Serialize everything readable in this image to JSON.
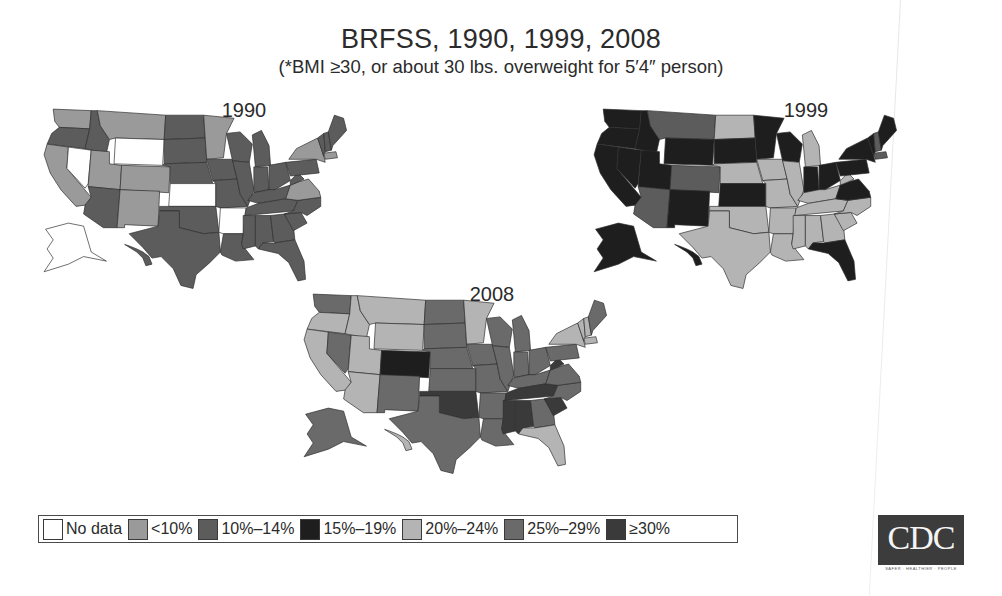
{
  "header": {
    "title": "BRFSS, 1990, 1999, 2008",
    "subtitle": "(*BMI ≥30, or about 30 lbs. overweight for 5′4″ person)"
  },
  "maps": [
    {
      "label": "1990"
    },
    {
      "label": "1999"
    },
    {
      "label": "2008"
    }
  ],
  "legend": {
    "items": [
      {
        "label": "No data",
        "color": "#ffffff"
      },
      {
        "label": "<10%",
        "color": "#9a9a9a"
      },
      {
        "label": "10%–14%",
        "color": "#5c5c5c"
      },
      {
        "label": "15%–19%",
        "color": "#1e1e1e"
      },
      {
        "label": "20%–24%",
        "color": "#b4b4b4"
      },
      {
        "label": "25%–29%",
        "color": "#6a6a6a"
      },
      {
        "label": "≥30%",
        "color": "#3a3a3a"
      }
    ]
  },
  "logo": {
    "text": "CDC",
    "tagline": "SAFER · HEALTHIER · PEOPLE"
  },
  "chart_data": {
    "type": "choropleth",
    "title": "BRFSS, 1990, 1999, 2008",
    "subtitle": "(*BMI ≥30, or about 30 lbs. overweight for 5′4″ person)",
    "categories": [
      "No data",
      "<10%",
      "10%–14%",
      "15%–19%",
      "20%–24%",
      "25%–29%",
      "≥30%"
    ],
    "legend_position": "bottom-left",
    "series": [
      {
        "name": "1990",
        "values": {
          "WA": "<10%",
          "OR": "10%–14%",
          "CA": "<10%",
          "NV": "No data",
          "ID": "10%–14%",
          "MT": "<10%",
          "WY": "No data",
          "UT": "<10%",
          "CO": "<10%",
          "AZ": "10%–14%",
          "NM": "<10%",
          "ND": "10%–14%",
          "SD": "10%–14%",
          "NE": "10%–14%",
          "KS": "No data",
          "OK": "10%–14%",
          "TX": "10%–14%",
          "MN": "<10%",
          "IA": "10%–14%",
          "MO": "10%–14%",
          "AR": "No data",
          "LA": "10%–14%",
          "WI": "10%–14%",
          "IL": "10%–14%",
          "MI": "10%–14%",
          "IN": "10%–14%",
          "OH": "10%–14%",
          "KY": "10%–14%",
          "TN": "10%–14%",
          "MS": "10%–14%",
          "AL": "10%–14%",
          "GA": "10%–14%",
          "FL": "10%–14%",
          "SC": "10%–14%",
          "NC": "10%–14%",
          "VA": "<10%",
          "WV": "10%–14%",
          "PA": "10%–14%",
          "NY": "<10%",
          "ME": "10%–14%",
          "VT": "10%–14%",
          "NH": "10%–14%",
          "MA": "<10%",
          "AK": "No data",
          "HI": "10%–14%"
        }
      },
      {
        "name": "1999",
        "values": {
          "WA": "15%–19%",
          "OR": "15%–19%",
          "CA": "15%–19%",
          "NV": "15%–19%",
          "ID": "15%–19%",
          "MT": "10%–14%",
          "WY": "15%–19%",
          "UT": "15%–19%",
          "CO": "10%–14%",
          "AZ": "10%–14%",
          "NM": "15%–19%",
          "ND": "20%–24%",
          "SD": "15%–19%",
          "NE": "20%–24%",
          "KS": "15%–19%",
          "OK": "20%–24%",
          "TX": "20%–24%",
          "MN": "15%–19%",
          "IA": "20%–24%",
          "MO": "20%–24%",
          "AR": "20%–24%",
          "LA": "20%–24%",
          "WI": "15%–19%",
          "IL": "20%–24%",
          "MI": "20%–24%",
          "IN": "15%–19%",
          "OH": "15%–19%",
          "KY": "20%–24%",
          "TN": "20%–24%",
          "MS": "20%–24%",
          "AL": "20%–24%",
          "GA": "20%–24%",
          "FL": "15%–19%",
          "SC": "20%–24%",
          "NC": "20%–24%",
          "VA": "15%–19%",
          "WV": "20%–24%",
          "PA": "15%–19%",
          "NY": "15%–19%",
          "ME": "15%–19%",
          "VT": "15%–19%",
          "NH": "10%–14%",
          "MA": "10%–14%",
          "AK": "15%–19%",
          "HI": "15%–19%"
        }
      },
      {
        "name": "2008",
        "values": {
          "WA": "25%–29%",
          "OR": "20%–24%",
          "CA": "20%–24%",
          "NV": "25%–29%",
          "ID": "20%–24%",
          "MT": "20%–24%",
          "WY": "20%–24%",
          "UT": "20%–24%",
          "CO": "15%–19%",
          "AZ": "20%–24%",
          "NM": "25%–29%",
          "ND": "25%–29%",
          "SD": "25%–29%",
          "NE": "25%–29%",
          "KS": "25%–29%",
          "OK": "≥30%",
          "TX": "25%–29%",
          "MN": "20%–24%",
          "IA": "25%–29%",
          "MO": "25%–29%",
          "AR": "25%–29%",
          "LA": "25%–29%",
          "WI": "25%–29%",
          "IL": "25%–29%",
          "MI": "25%–29%",
          "IN": "25%–29%",
          "OH": "25%–29%",
          "KY": "25%–29%",
          "TN": "≥30%",
          "MS": "≥30%",
          "AL": "≥30%",
          "GA": "25%–29%",
          "FL": "20%–24%",
          "SC": "≥30%",
          "NC": "25%–29%",
          "VA": "25%–29%",
          "WV": "≥30%",
          "PA": "25%–29%",
          "NY": "20%–24%",
          "ME": "25%–29%",
          "VT": "20%–24%",
          "NH": "20%–24%",
          "MA": "20%–24%",
          "AK": "25%–29%",
          "HI": "20%–24%"
        }
      }
    ]
  }
}
